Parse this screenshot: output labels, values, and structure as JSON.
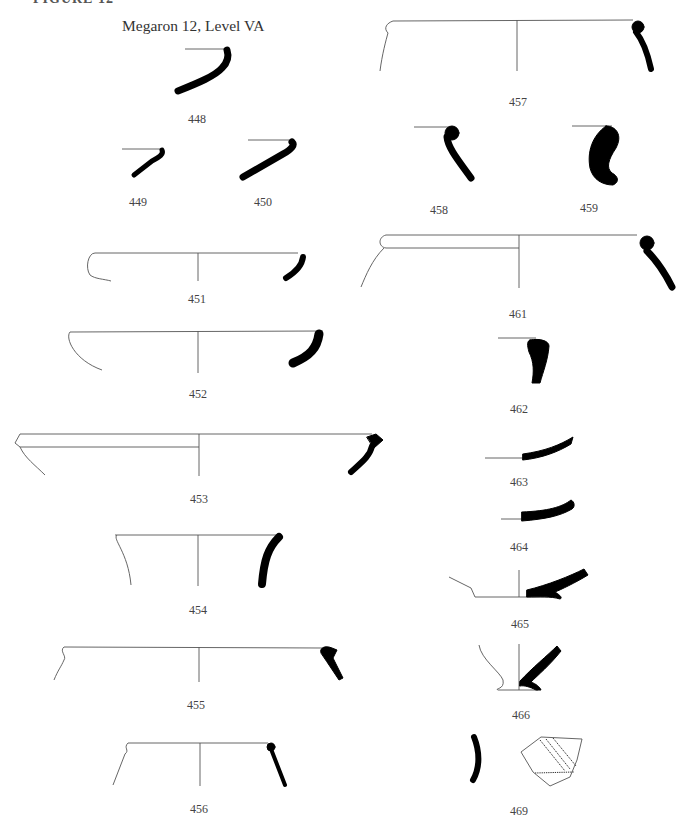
{
  "page": {
    "header_cut": "FIGURE 12",
    "title": "Megaron 12, Level VA"
  },
  "figures": {
    "f448": {
      "label": "448"
    },
    "f449": {
      "label": "449"
    },
    "f450": {
      "label": "450"
    },
    "f451": {
      "label": "451"
    },
    "f452": {
      "label": "452"
    },
    "f453": {
      "label": "453"
    },
    "f454": {
      "label": "454"
    },
    "f455": {
      "label": "455"
    },
    "f456": {
      "label": "456"
    },
    "f457": {
      "label": "457"
    },
    "f458": {
      "label": "458"
    },
    "f459": {
      "label": "459"
    },
    "f461": {
      "label": "461"
    },
    "f462": {
      "label": "462"
    },
    "f463": {
      "label": "463"
    },
    "f464": {
      "label": "464"
    },
    "f465": {
      "label": "465"
    },
    "f466": {
      "label": "466"
    },
    "f469": {
      "label": "469"
    }
  }
}
